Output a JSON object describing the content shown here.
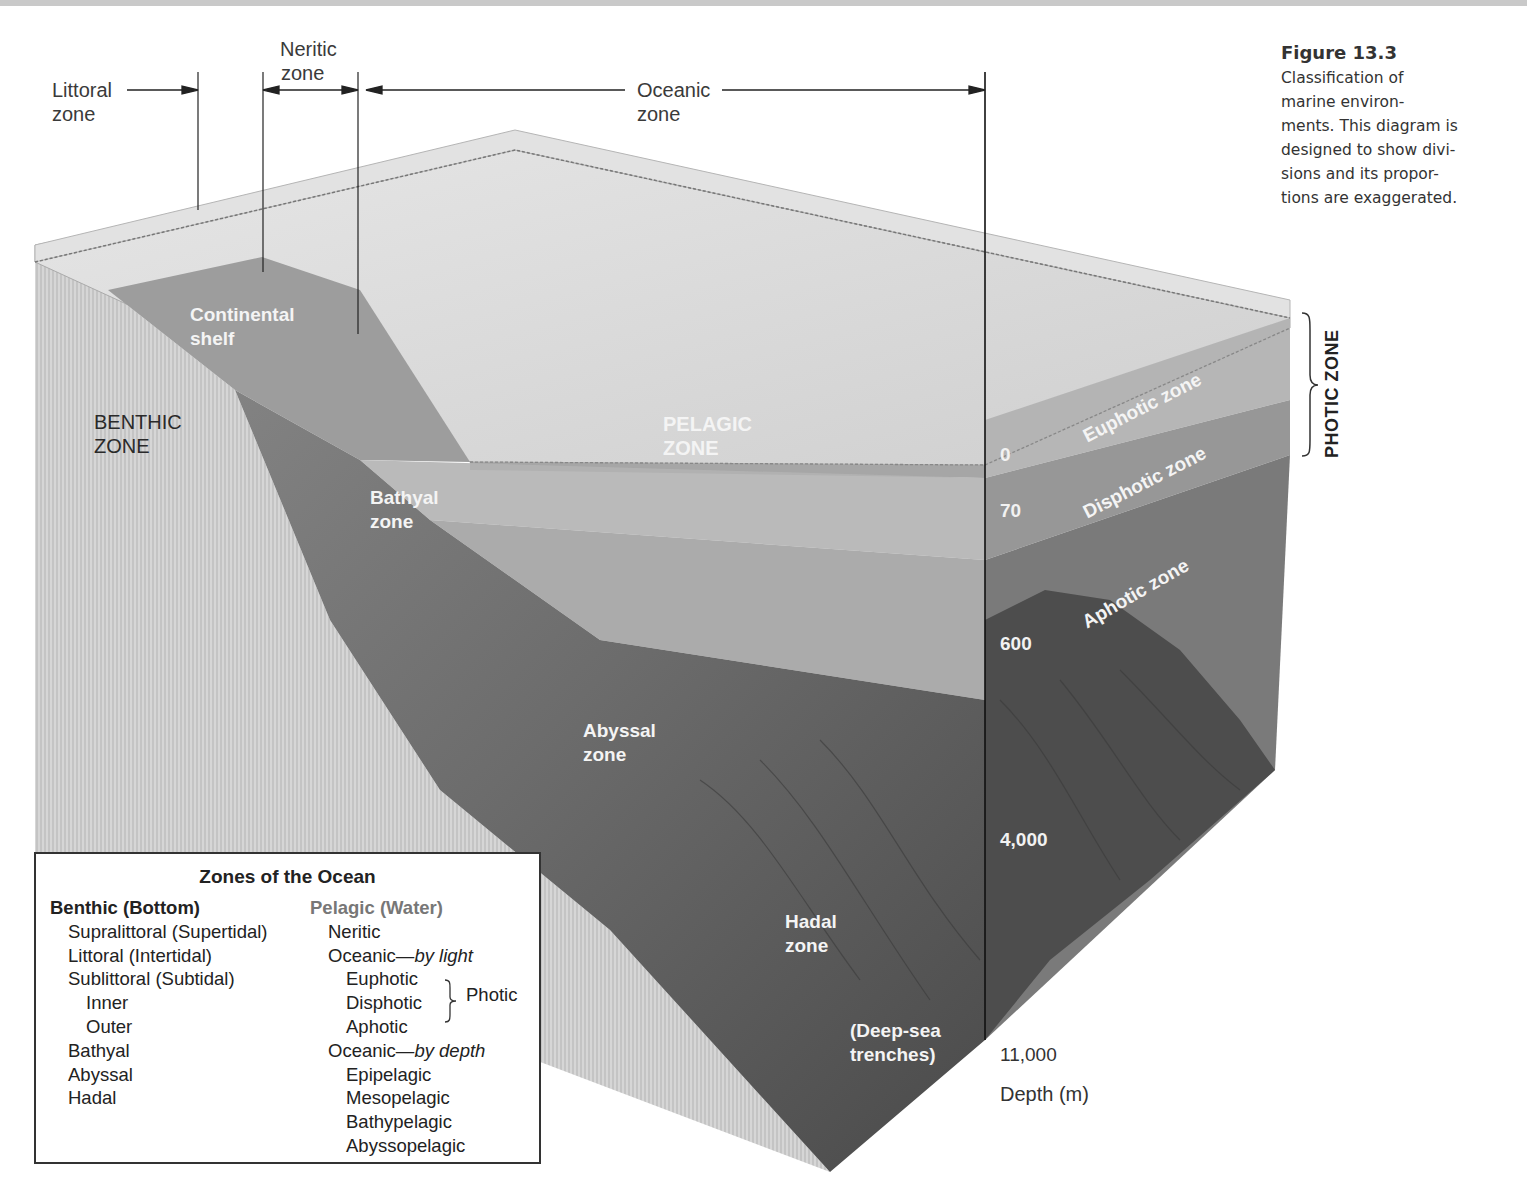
{
  "figure": {
    "number": "Figure 13.3",
    "caption": "Classification of marine environments. This diagram is designed to show divisions and its proportions are exaggerated.",
    "caption_lines": [
      "Classification of",
      "marine environ-",
      "ments. This diagram is",
      "designed to show divi-",
      "sions and its propor-",
      "tions are exaggerated."
    ]
  },
  "horizontal_zones": {
    "littoral": {
      "line1": "Littoral",
      "line2": "zone"
    },
    "neritic": {
      "line1": "Neritic",
      "line2": "zone"
    },
    "oceanic": {
      "line1": "Oceanic",
      "line2": "zone"
    }
  },
  "block_labels": {
    "continental_shelf": {
      "line1": "Continental",
      "line2": "shelf"
    },
    "benthic_zone": {
      "line1": "BENTHIC",
      "line2": "ZONE"
    },
    "pelagic_zone": {
      "line1": "PELAGIC",
      "line2": "ZONE"
    },
    "bathyal_zone": {
      "line1": "Bathyal",
      "line2": "zone"
    },
    "abyssal_zone": {
      "line1": "Abyssal",
      "line2": "zone"
    },
    "hadal_zone": {
      "line1": "Hadal",
      "line2": "zone"
    },
    "trenches": {
      "line1": "(Deep-sea",
      "line2": "trenches)"
    }
  },
  "light_zones": {
    "euphotic": "Euphotic zone",
    "disphotic": "Disphotic zone",
    "aphotic": "Aphotic zone",
    "photic_zone": "PHOTIC ZONE"
  },
  "depth_axis": {
    "ticks": [
      "0",
      "70",
      "600",
      "4,000",
      "11,000"
    ],
    "label": "Depth (m)"
  },
  "legend": {
    "title": "Zones of the Ocean",
    "benthic": {
      "heading": "Benthic (Bottom)",
      "items": [
        {
          "label": "Supralittoral (Supertidal)",
          "indent": 1
        },
        {
          "label": "Littoral (Intertidal)",
          "indent": 1
        },
        {
          "label": "Sublittoral (Subtidal)",
          "indent": 1
        },
        {
          "label": "Inner",
          "indent": 2
        },
        {
          "label": "Outer",
          "indent": 2
        },
        {
          "label": "Bathyal",
          "indent": 1
        },
        {
          "label": "Abyssal",
          "indent": 1
        },
        {
          "label": "Hadal",
          "indent": 1
        }
      ]
    },
    "pelagic": {
      "heading": "Pelagic (Water)",
      "neritic": "Neritic",
      "oceanic_light_prefix": "Oceanic—",
      "oceanic_light_suffix": "by light",
      "euphotic": "Euphotic",
      "disphotic": "Disphotic",
      "aphotic": "Aphotic",
      "photic_group": "Photic",
      "oceanic_depth_prefix": "Oceanic—",
      "oceanic_depth_suffix": "by depth",
      "epipelagic": "Epipelagic",
      "mesopelagic": "Mesopelagic",
      "bathypelagic": "Bathypelagic",
      "abyssopelagic": "Abyssopelagic"
    }
  },
  "colors": {
    "surface_water": "#d8d8d8",
    "euphotic": "#b8b8b8",
    "disphotic": "#9a9a9a",
    "aphotic": "#7c7c7c",
    "seafloor": "#6a6a6a",
    "deep_floor": "#4e4e4e",
    "crust": "#cfcfcf"
  }
}
